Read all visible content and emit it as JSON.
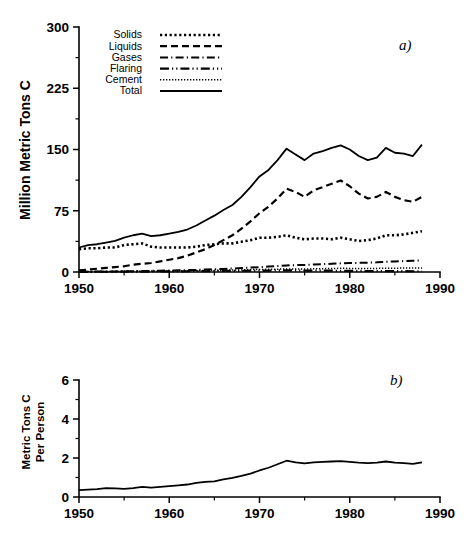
{
  "figure": {
    "panels": [
      {
        "tag": "a)",
        "ylabel": "Million Metric Tons C",
        "xticks": [
          "1950",
          "1960",
          "1970",
          "1980",
          "1990"
        ],
        "yticks": [
          "0",
          "75",
          "150",
          "225",
          "300"
        ]
      },
      {
        "tag": "b)",
        "ylabel_line1": "Metric Tons C",
        "ylabel_line2": "Per Person",
        "xticks": [
          "1950",
          "1960",
          "1970",
          "1980",
          "1990"
        ],
        "yticks": [
          "0",
          "2",
          "4",
          "6"
        ]
      }
    ],
    "legend": {
      "items": [
        {
          "label": "Solids",
          "style": "dotted-square"
        },
        {
          "label": "Liquids",
          "style": "dashed"
        },
        {
          "label": "Gases",
          "style": "dash-dot"
        },
        {
          "label": "Flaring",
          "style": "dash-dot-dot"
        },
        {
          "label": "Cement",
          "style": "fine-dotted"
        },
        {
          "label": "Total",
          "style": "solid"
        }
      ]
    },
    "colors": {
      "ink": "#000000",
      "background": "#ffffff"
    }
  },
  "chart_data": [
    {
      "type": "line",
      "title": "",
      "panel": "a)",
      "xlabel": "",
      "ylabel": "Million Metric Tons C",
      "xlim": [
        1950,
        1990
      ],
      "ylim": [
        0,
        300
      ],
      "ytick_values": [
        0,
        75,
        150,
        225,
        300
      ],
      "xtick_values": [
        1950,
        1960,
        1970,
        1980,
        1990
      ],
      "xtick_minor_values": [
        1955,
        1965,
        1975,
        1985
      ],
      "grid": false,
      "legend_position": "top-left",
      "x": [
        1950,
        1951,
        1952,
        1953,
        1954,
        1955,
        1956,
        1957,
        1958,
        1959,
        1960,
        1961,
        1962,
        1963,
        1964,
        1965,
        1966,
        1967,
        1968,
        1969,
        1970,
        1971,
        1972,
        1973,
        1974,
        1975,
        1976,
        1977,
        1978,
        1979,
        1980,
        1981,
        1982,
        1983,
        1984,
        1985,
        1986,
        1987,
        1988
      ],
      "series": [
        {
          "name": "Total",
          "style": "solid",
          "values": [
            30,
            33,
            34,
            36,
            38,
            42,
            45,
            47,
            44,
            45,
            47,
            49,
            52,
            57,
            63,
            69,
            76,
            82,
            92,
            104,
            117,
            125,
            137,
            151,
            144,
            137,
            145,
            148,
            152,
            155,
            150,
            142,
            137,
            140,
            152,
            146,
            145,
            142,
            156
          ]
        },
        {
          "name": "Liquids",
          "style": "dashed",
          "values": [
            2,
            3,
            4,
            5,
            6,
            7,
            9,
            10,
            11,
            13,
            15,
            17,
            20,
            24,
            28,
            33,
            39,
            45,
            53,
            62,
            72,
            80,
            90,
            102,
            98,
            92,
            100,
            104,
            108,
            112,
            105,
            96,
            90,
            92,
            98,
            92,
            88,
            86,
            92
          ]
        },
        {
          "name": "Solids",
          "style": "dotted-square",
          "values": [
            28,
            29,
            29,
            30,
            30,
            33,
            34,
            35,
            31,
            30,
            30,
            30,
            30,
            31,
            33,
            34,
            35,
            35,
            37,
            39,
            42,
            42,
            43,
            45,
            42,
            40,
            41,
            41,
            40,
            42,
            40,
            38,
            39,
            41,
            45,
            45,
            46,
            48,
            50
          ]
        },
        {
          "name": "Gases",
          "style": "dash-dot",
          "values": [
            0.3,
            0.4,
            0.5,
            0.6,
            0.7,
            0.9,
            1.0,
            1.2,
            1.4,
            1.6,
            1.8,
            2.0,
            2.3,
            2.6,
            3.0,
            3.4,
            3.8,
            4.3,
            4.8,
            5.4,
            6.0,
            6.6,
            7.3,
            8.0,
            8.4,
            8.6,
            9.2,
            9.6,
            10.0,
            10.6,
            10.9,
            11.2,
            11.4,
            11.8,
            12.6,
            13.0,
            13.4,
            13.8,
            14.2
          ]
        },
        {
          "name": "Cement",
          "style": "fine-dotted",
          "values": [
            0.4,
            0.5,
            0.5,
            0.6,
            0.7,
            0.8,
            0.9,
            1.0,
            1.1,
            1.2,
            1.3,
            1.4,
            1.5,
            1.7,
            1.9,
            2.1,
            2.3,
            2.4,
            2.6,
            2.9,
            3.1,
            3.3,
            3.5,
            3.8,
            3.8,
            3.7,
            3.9,
            4.1,
            4.3,
            4.5,
            4.4,
            4.3,
            4.2,
            4.4,
            4.6,
            4.7,
            4.8,
            4.9,
            5.0
          ]
        },
        {
          "name": "Flaring",
          "style": "dash-dot-dot",
          "values": [
            0.2,
            0.2,
            0.3,
            0.3,
            0.4,
            0.4,
            0.5,
            0.5,
            0.6,
            0.6,
            0.7,
            0.8,
            0.9,
            1.0,
            1.1,
            1.2,
            1.3,
            1.4,
            1.5,
            1.6,
            1.7,
            1.8,
            1.9,
            2.0,
            1.9,
            1.8,
            1.8,
            1.7,
            1.6,
            1.5,
            1.4,
            1.3,
            1.2,
            1.1,
            1.1,
            1.0,
            1.0,
            0.9,
            0.9
          ]
        }
      ]
    },
    {
      "type": "line",
      "title": "",
      "panel": "b)",
      "xlabel": "",
      "ylabel": "Metric Tons C Per Person",
      "xlim": [
        1950,
        1990
      ],
      "ylim": [
        0,
        6
      ],
      "ytick_values": [
        0,
        2,
        4,
        6
      ],
      "xtick_values": [
        1950,
        1960,
        1970,
        1980,
        1990
      ],
      "xtick_minor_values": [
        1955,
        1965,
        1975,
        1985
      ],
      "grid": false,
      "legend_position": "none",
      "x": [
        1950,
        1951,
        1952,
        1953,
        1954,
        1955,
        1956,
        1957,
        1958,
        1959,
        1960,
        1961,
        1962,
        1963,
        1964,
        1965,
        1966,
        1967,
        1968,
        1969,
        1970,
        1971,
        1972,
        1973,
        1974,
        1975,
        1976,
        1977,
        1978,
        1979,
        1980,
        1981,
        1982,
        1983,
        1984,
        1985,
        1986,
        1987,
        1988
      ],
      "series": [
        {
          "name": "Per Person",
          "style": "solid",
          "values": [
            0.35,
            0.38,
            0.4,
            0.46,
            0.44,
            0.42,
            0.46,
            0.52,
            0.48,
            0.52,
            0.56,
            0.6,
            0.64,
            0.72,
            0.78,
            0.8,
            0.9,
            0.98,
            1.08,
            1.2,
            1.36,
            1.5,
            1.68,
            1.86,
            1.78,
            1.72,
            1.78,
            1.8,
            1.82,
            1.84,
            1.8,
            1.76,
            1.74,
            1.76,
            1.82,
            1.76,
            1.74,
            1.7,
            1.78
          ]
        }
      ]
    }
  ]
}
